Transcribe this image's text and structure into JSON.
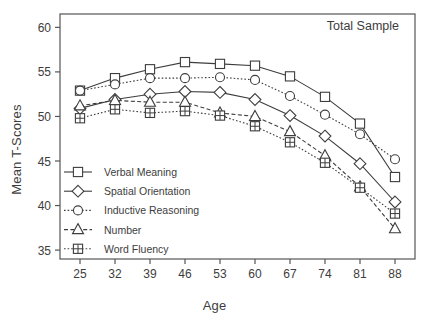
{
  "chart_data": {
    "type": "line",
    "title": "Total Sample",
    "xlabel": "Age",
    "ylabel": "Mean T-Scores",
    "categories": [
      25,
      32,
      39,
      46,
      53,
      60,
      67,
      74,
      81,
      88
    ],
    "x": [
      25,
      32,
      39,
      46,
      53,
      60,
      67,
      74,
      81,
      88
    ],
    "xlim": [
      21,
      92
    ],
    "ylim": [
      34,
      61.5
    ],
    "yticks": [
      35,
      40,
      45,
      50,
      55,
      60
    ],
    "xticks": [
      25,
      32,
      39,
      46,
      53,
      60,
      67,
      74,
      81,
      88
    ],
    "grid": false,
    "legend_position": "lower-left inside axes",
    "series": [
      {
        "name": "Verbal Meaning",
        "marker": "square",
        "linestyle": "solid",
        "values": [
          52.9,
          54.3,
          55.3,
          56.1,
          55.9,
          55.7,
          54.5,
          52.2,
          49.2,
          43.2
        ]
      },
      {
        "name": "Spatial Orientation",
        "marker": "diamond",
        "linestyle": "solid",
        "values": [
          50.9,
          51.9,
          52.5,
          52.8,
          52.7,
          51.9,
          50.1,
          47.8,
          44.7,
          40.4
        ]
      },
      {
        "name": "Inductive Reasoning",
        "marker": "circle",
        "linestyle": "dotted",
        "values": [
          52.9,
          53.6,
          54.3,
          54.3,
          54.4,
          54.1,
          52.3,
          50.2,
          48.0,
          45.2
        ]
      },
      {
        "name": "Number",
        "marker": "triangle",
        "linestyle": "dashed",
        "values": [
          51.2,
          51.8,
          51.6,
          51.6,
          50.4,
          50.0,
          48.3,
          45.6,
          42.1,
          37.4
        ]
      },
      {
        "name": "Word Fluency",
        "marker": "crossed-square",
        "linestyle": "dotted",
        "values": [
          49.8,
          50.8,
          50.4,
          50.6,
          50.1,
          48.9,
          47.1,
          44.8,
          42.0,
          39.1
        ]
      }
    ]
  },
  "colors": {
    "ink": "#3d3d3d",
    "frame": "#555555",
    "background": "#ffffff"
  }
}
